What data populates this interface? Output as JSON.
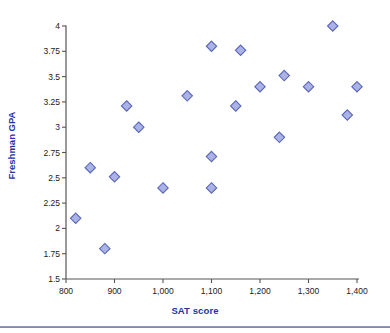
{
  "chart_data": {
    "type": "scatter",
    "title": "",
    "xlabel": "SAT score",
    "ylabel": "Freshman GPA",
    "xlim": [
      800,
      1400
    ],
    "ylim": [
      1.5,
      4
    ],
    "xticks": [
      800,
      900,
      1000,
      1100,
      1200,
      1300,
      1400
    ],
    "xtick_labels": [
      "800",
      "900",
      "1,000",
      "1,100",
      "1,200",
      "1,300",
      "1,400"
    ],
    "yticks": [
      1.5,
      1.75,
      2,
      2.25,
      2.5,
      2.75,
      3,
      3.25,
      3.5,
      3.75,
      4
    ],
    "ytick_labels": [
      "1.5",
      "1.75",
      "2",
      "2.25",
      "2.5",
      "2.75",
      "3",
      "3.25",
      "3.5",
      "3.75",
      "4"
    ],
    "grid": false,
    "legend": false,
    "marker": "diamond",
    "marker_fill": "#aab2e6",
    "marker_edge": "#5a67b8",
    "axis_color": "#555555",
    "label_color": "#2233aa",
    "tick_color": "#1a1a1a",
    "points": [
      {
        "x": 820,
        "y": 2.1
      },
      {
        "x": 850,
        "y": 2.6
      },
      {
        "x": 880,
        "y": 1.8
      },
      {
        "x": 900,
        "y": 2.51
      },
      {
        "x": 925,
        "y": 3.21
      },
      {
        "x": 950,
        "y": 3.0
      },
      {
        "x": 1000,
        "y": 2.4
      },
      {
        "x": 1050,
        "y": 3.31
      },
      {
        "x": 1100,
        "y": 3.8
      },
      {
        "x": 1100,
        "y": 2.71
      },
      {
        "x": 1100,
        "y": 2.4
      },
      {
        "x": 1150,
        "y": 3.21
      },
      {
        "x": 1160,
        "y": 3.76
      },
      {
        "x": 1200,
        "y": 3.4
      },
      {
        "x": 1240,
        "y": 2.9
      },
      {
        "x": 1250,
        "y": 3.51
      },
      {
        "x": 1300,
        "y": 3.4
      },
      {
        "x": 1350,
        "y": 4.0
      },
      {
        "x": 1380,
        "y": 3.12
      },
      {
        "x": 1400,
        "y": 3.4
      }
    ]
  }
}
